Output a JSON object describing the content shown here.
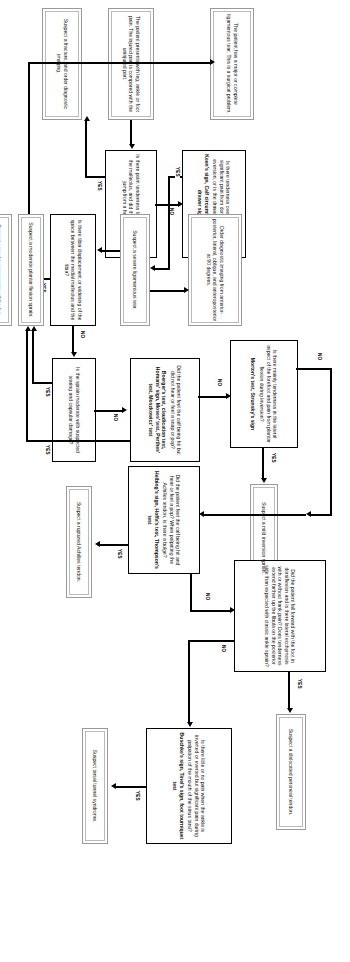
{
  "diagram": {
    "labels": {
      "yes": "YES",
      "no": "NO"
    },
    "nodes": {
      "start": "The patient presents with leg, ankle or foot pain. The injured part is compared with the uninjured part.",
      "q_point_tenderness": "Is there point tenderness lateral or medial to the malleolus, and did the patient fall or jump from a height?",
      "out_fracture": "Suspect a fracture, and order diagnostic imaging.",
      "q_keens": "Is there tenderness over both malleoli, significant pain from dorsiflexion during eversion, or is the drawer sign positive?",
      "keens_tests": "Keen's sign, Calf circumference, Anterior drawer sign",
      "out_severe_lig": "Suspect a severe ligamentous tear.",
      "out_imaging": "Order diagnostic imaging from anterior-posterior, lateral, oblique, and anteroposterior at 90 degrees.",
      "q_tibia_displacement": "Is there tibia displacement or widening of the space between the medial malleolus and the tibia?",
      "out_surgical": "The patient has a major or complete ligamentous tear. This is a surgical problem.",
      "q_sprain_moderate": "Is the sprain moderate with suspected tearing and capsular damage?",
      "out_moderate_sprain": "Suspect a moderate plantar flexion sprain.",
      "q_boergers": "Did the patient feel the calf being hit but did not hear or feel a snap or pop?",
      "boergers_tests": "Boerger's test, claudication test, Homans' sign, Moses' test, Perthes' test, Moszkowicz' test",
      "out_vascular": "Suspect vascular compromise of the leg.",
      "q_morton": "Is there mainly tenderness in the lateral aspect of the forefoot and pain from plantar flexion during inversion?",
      "morton_tests": "Morton's test, Strunsky's sign",
      "out_mild_inversion": "Suspect a mild inversion sprain.",
      "q_helbing": "Did the patient feel the calf being hit and hear or feel a pop? When palpating the Achilles tendon, is there a bulge?",
      "helbing_tests": "Helbing's sign, Hoffa's test, Thompson's test",
      "out_ruptured_achilles": "Suspect a ruptured Achilles tendon.",
      "q_inversion_eversion": "Did the patient fall forward with the foot in dorsiflexion and is there lateral ecchymosis with or without frank pain? Does tenderness extend farther up the fibula on the posterior side than expected with classic ankle sprain?",
      "out_dislocated_peroneal": "Suspect a dislocated peroneal tendon.",
      "q_tunnel": "Is there little or no pain when the ankle is inverted or everted but significant pain during palpation of the mouth of the sinus tarsi?",
      "tunnel_tests": "Buschke's sign, Tinel's sign, foot tourniquet test",
      "out_tarsal_tunnel": "Suspect tarsal tunnel syndrome."
    }
  }
}
